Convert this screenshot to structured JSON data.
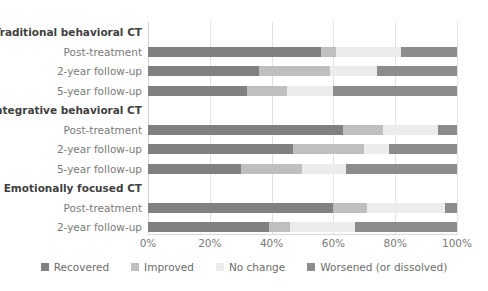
{
  "chart_data": {
    "type": "bar",
    "orientation": "horizontal",
    "stacked": true,
    "stack_mode": "percent",
    "title": "",
    "xlabel": "",
    "ylabel": "",
    "xlim": [
      0,
      100
    ],
    "xticks": [
      "0%",
      "20%",
      "40%",
      "60%",
      "80%",
      "100%"
    ],
    "xtick_values": [
      0,
      20,
      40,
      60,
      80,
      100
    ],
    "grid": true,
    "legend_position": "bottom",
    "legend": [
      {
        "label": "Recovered",
        "color": "#808080"
      },
      {
        "label": "Improved",
        "color": "#bfbfbf"
      },
      {
        "label": "No change",
        "color": "#ececec"
      },
      {
        "label": "Worsened (or dissolved)",
        "color": "#8c8c8c"
      }
    ],
    "series": [
      {
        "name": "Recovered",
        "color": "#808080",
        "values": [
          56,
          36,
          32,
          63,
          47,
          30,
          60,
          39
        ]
      },
      {
        "name": "Improved",
        "color": "#bfbfbf",
        "values": [
          5,
          23,
          13,
          13,
          23,
          20,
          11,
          7
        ]
      },
      {
        "name": "No change",
        "color": "#ececec",
        "values": [
          21,
          15,
          15,
          18,
          8,
          14,
          25,
          21
        ]
      },
      {
        "name": "Worsened (or dissolved)",
        "color": "#8c8c8c",
        "values": [
          18,
          26,
          40,
          6,
          22,
          36,
          4,
          33
        ]
      }
    ],
    "groups": [
      {
        "group_label": "Traditional behavioral CT",
        "rows": [
          {
            "label": "Post-treatment",
            "values": [
              56,
              5,
              21,
              18
            ]
          },
          {
            "label": "2-year follow-up",
            "values": [
              36,
              23,
              15,
              26
            ]
          },
          {
            "label": "5-year follow-up",
            "values": [
              32,
              13,
              15,
              40
            ]
          }
        ]
      },
      {
        "group_label": "Integrative behavioral CT",
        "rows": [
          {
            "label": "Post-treatment",
            "values": [
              63,
              13,
              18,
              6
            ]
          },
          {
            "label": "2-year follow-up",
            "values": [
              47,
              23,
              8,
              22
            ]
          },
          {
            "label": "5-year follow-up",
            "values": [
              30,
              20,
              14,
              36
            ]
          }
        ]
      },
      {
        "group_label": "Emotionally focused CT",
        "rows": [
          {
            "label": "Post-treatment",
            "values": [
              60,
              11,
              25,
              4
            ]
          },
          {
            "label": "2-year follow-up",
            "values": [
              39,
              7,
              21,
              33
            ]
          }
        ]
      }
    ]
  }
}
